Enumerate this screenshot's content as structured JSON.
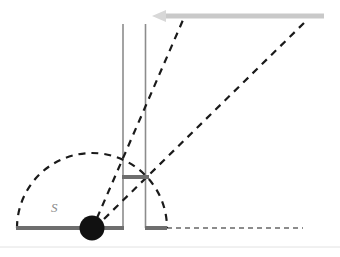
{
  "figure": {
    "background_color": "#ffffff",
    "width": 340,
    "height": 257,
    "labels": [
      {
        "name": "source-label",
        "text": "S",
        "color": "#8a8a8a",
        "x": 51,
        "y": 200,
        "style": "italic"
      }
    ],
    "colors": {
      "barrier_gray": "#6e6e6e",
      "vertical_line_gray": "#8c8c8c",
      "incoming_ray_gray": "#c9c9c9",
      "dashed_black": "#1a1a1a",
      "source_dot": "#111111",
      "frame_line": "#e2e2e2",
      "label_gray": "#8a8a8a"
    },
    "elements": {
      "source_dot": {
        "name": "source-point",
        "cx": 92,
        "cy": 228,
        "r": 12.5,
        "color": "#111111"
      },
      "baseline_left": {
        "name": "baseline-left-barrier",
        "x1": 16,
        "y1": 228,
        "x2": 124,
        "y2": 228,
        "width": 4,
        "color": "#6e6e6e"
      },
      "baseline_right": {
        "name": "baseline-right-barrier",
        "x1": 145,
        "y1": 228,
        "x2": 167,
        "y2": 228,
        "width": 4,
        "color": "#6e6e6e"
      },
      "baseline_dashed": {
        "name": "baseline-dashed-extension",
        "x1": 167,
        "y1": 228,
        "x2": 303,
        "y2": 228,
        "width": 1.2,
        "color": "#1a1a1a",
        "dash": "5 4"
      },
      "vertical_line_left": {
        "name": "slit-wall-left",
        "x1": 123,
        "y1": 24,
        "x2": 123,
        "y2": 228,
        "width": 1.6,
        "color": "#8c8c8c"
      },
      "vertical_line_right": {
        "name": "slit-wall-right",
        "x1": 145.5,
        "y1": 24,
        "x2": 145.5,
        "y2": 228,
        "width": 1.6,
        "color": "#8c8c8c"
      },
      "slit_bar": {
        "name": "slit-aperture-bar",
        "x1": 122,
        "y1": 177,
        "x2": 149,
        "y2": 177,
        "width": 4,
        "color": "#6e6e6e"
      },
      "incoming_ray": {
        "name": "incoming-plane-wave-arrow",
        "x1": 324,
        "y1": 16,
        "x2": 158,
        "y2": 16,
        "width": 5,
        "color": "#c9c9c9",
        "arrowhead": "left"
      },
      "wavefront_arc": {
        "name": "semicircular-wavefront-arc",
        "cx": 92,
        "cy": 228,
        "r": 75,
        "start_angle_deg": 180,
        "end_angle_deg": 0,
        "width": 2.2,
        "color": "#1a1a1a",
        "dash": "7 6"
      },
      "diffracted_ray_1": {
        "name": "diffracted-ray-inner",
        "x1": 97,
        "y1": 218,
        "x2": 183,
        "y2": 20,
        "width": 2.2,
        "color": "#1a1a1a",
        "dash": "7 6"
      },
      "diffracted_ray_2": {
        "name": "diffracted-ray-outer",
        "x1": 104,
        "y1": 219,
        "x2": 306,
        "y2": 21,
        "width": 2.2,
        "color": "#1a1a1a",
        "dash": "7 6"
      },
      "frame_bottom": {
        "name": "figure-bottom-rule",
        "x1": 0,
        "y1": 247,
        "x2": 340,
        "y2": 247,
        "width": 1,
        "color": "#e2e2e2"
      }
    }
  }
}
